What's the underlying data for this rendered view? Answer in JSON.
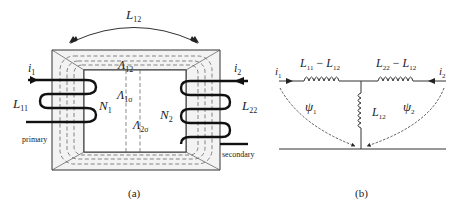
{
  "figure_a": {
    "caption": "(a)",
    "mutual_label": {
      "main": "L",
      "sub": "12"
    },
    "primary_current": {
      "main": "i",
      "sub": "1"
    },
    "secondary_current": {
      "main": "i",
      "sub": "2"
    },
    "primary_inductance": {
      "main": "L",
      "sub": "11"
    },
    "secondary_inductance": {
      "main": "L",
      "sub": "22"
    },
    "primary_turns": {
      "main": "N",
      "sub": "1"
    },
    "secondary_turns": {
      "main": "N",
      "sub": "2"
    },
    "mutual_permeance": {
      "main": "Λ",
      "sub": "12"
    },
    "leakage_permeance_1": {
      "main": "Λ",
      "sub": "1σ"
    },
    "leakage_permeance_2": {
      "main": "Λ",
      "sub": "2σ"
    },
    "primary_label": "primary",
    "secondary_label": "secondary"
  },
  "figure_b": {
    "caption": "(b)",
    "left_series": {
      "a": "L",
      "a_sub": "11",
      "op": " − ",
      "b": "L",
      "b_sub": "12"
    },
    "right_series": {
      "a": "L",
      "a_sub": "22",
      "op": " − ",
      "b": "L",
      "b_sub": "12"
    },
    "shunt": {
      "main": "L",
      "sub": "12"
    },
    "left_current": {
      "main": "i",
      "sub": "1"
    },
    "right_current": {
      "main": "i",
      "sub": "2"
    },
    "flux_1": {
      "main": "ψ",
      "sub": "1"
    },
    "flux_2": {
      "main": "ψ",
      "sub": "2"
    }
  },
  "colors": {
    "line": "#222222",
    "core_fill": "#f4f4f4",
    "dashed": "#555555"
  }
}
